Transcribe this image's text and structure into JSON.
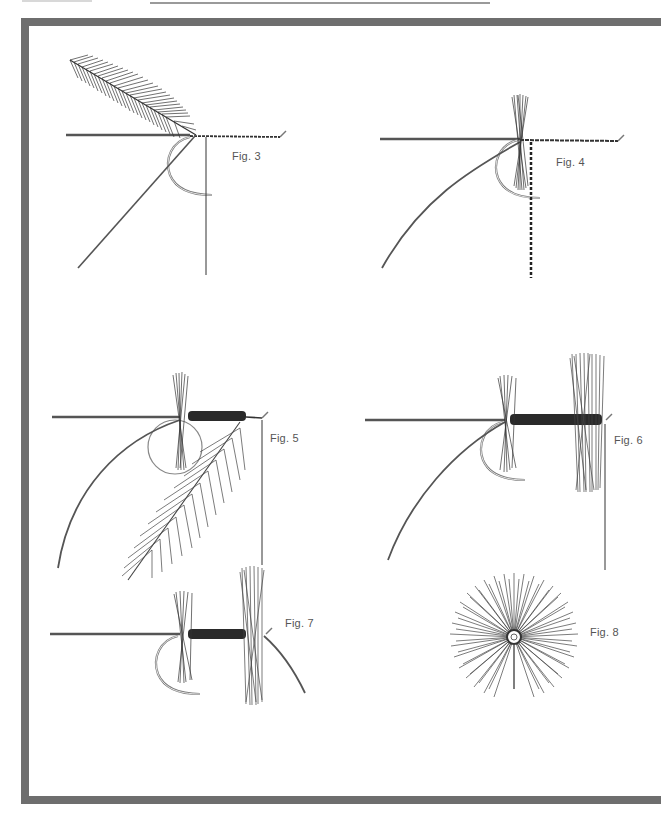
{
  "page": {
    "running_head_text": "",
    "frame_color": "#6e6e6e"
  },
  "figures": [
    {
      "id": "fig3",
      "label": "Fig. 3"
    },
    {
      "id": "fig4",
      "label": "Fig. 4"
    },
    {
      "id": "fig5",
      "label": "Fig. 5"
    },
    {
      "id": "fig6",
      "label": "Fig. 6"
    },
    {
      "id": "fig7",
      "label": "Fig. 7"
    },
    {
      "id": "fig8",
      "label": "Fig. 8"
    }
  ]
}
